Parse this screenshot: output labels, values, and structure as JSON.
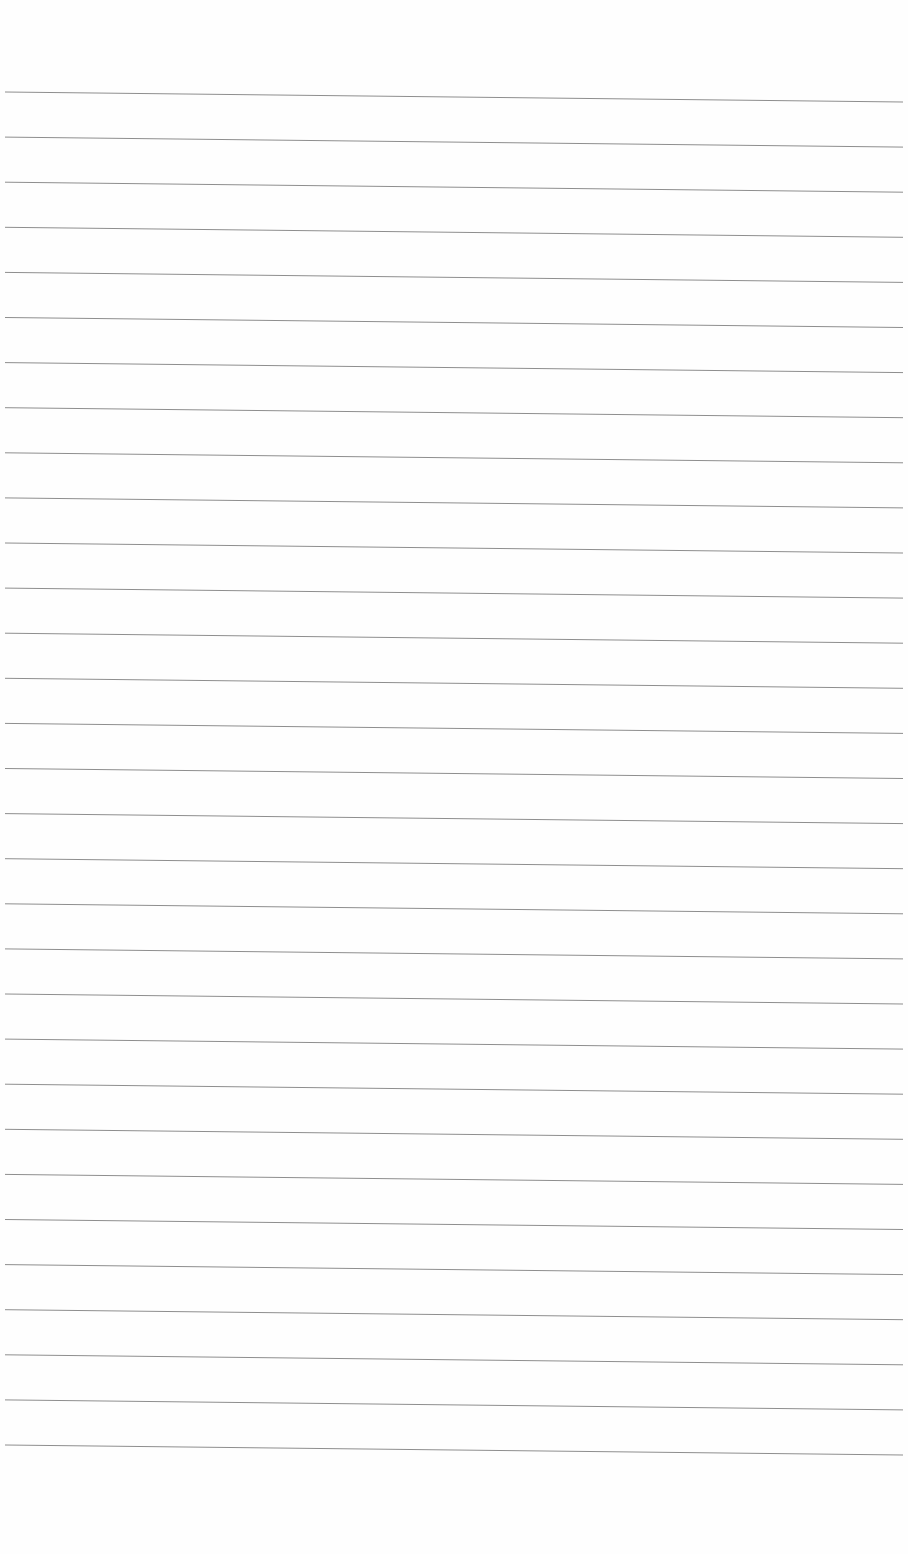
{
  "page": {
    "type": "lined-paper",
    "background": "#fefefe",
    "line_color": "#8e8e8e",
    "line_count": 31,
    "first_line_y_left": 92,
    "first_line_y_right": 102,
    "line_spacing": 45.1,
    "line_x_start": 5,
    "line_x_end": 903
  }
}
